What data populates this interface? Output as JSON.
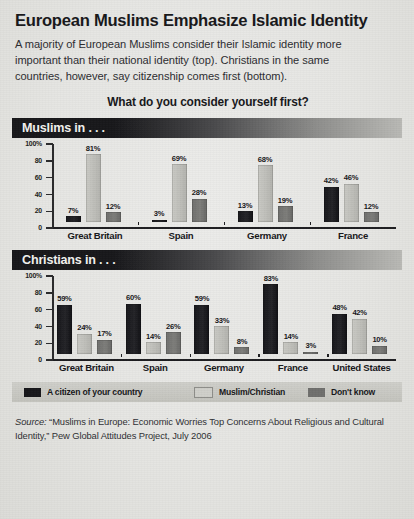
{
  "header": {
    "title": "European Muslims Emphasize Islamic Identity",
    "subtitle": "A majority of European Muslims consider their Islamic identity more important than their national identity (top). Christians in the same countries, however, say citizenship comes first (bottom).",
    "question": "What do you consider yourself first?"
  },
  "legend": {
    "items": [
      {
        "label": "A citizen of your country",
        "color": "#16161a",
        "swatch": "swatch-black"
      },
      {
        "label": "Muslim/Christian",
        "color": "#cfcfca",
        "swatch": "swatch-light-gray"
      },
      {
        "label": "Don't know",
        "color": "#6f6f6d",
        "swatch": "swatch-dark-gray"
      }
    ]
  },
  "source": {
    "prefix": "Source:",
    "text": " “Muslims in Europe: Economic Worries Top Concerns About Religious and Cultural Identity,” Pew Global Attitudes Project, July 2006"
  },
  "chart_data": [
    {
      "type": "bar",
      "title": "Muslims in . . .",
      "xlabel": "",
      "ylabel": "",
      "ylim": [
        0,
        100
      ],
      "yticks": [
        0,
        20,
        40,
        60,
        80,
        100
      ],
      "ytick_labels": [
        "0",
        "20",
        "40",
        "60",
        "80",
        "100%"
      ],
      "grid": false,
      "legend_position": "bottom",
      "categories": [
        "Great Britain",
        "Spain",
        "Germany",
        "France"
      ],
      "series": [
        {
          "name": "A citizen of your country",
          "color": "#16161a",
          "values": [
            7,
            3,
            13,
            42
          ],
          "labels": [
            "7%",
            "3%",
            "13%",
            "42%"
          ]
        },
        {
          "name": "Muslim/Christian",
          "color": "#cfcfca",
          "values": [
            81,
            69,
            68,
            46
          ],
          "labels": [
            "81%",
            "69%",
            "68%",
            "46%"
          ]
        },
        {
          "name": "Don't know",
          "color": "#6f6f6d",
          "values": [
            12,
            28,
            19,
            12
          ],
          "labels": [
            "12%",
            "28%",
            "19%",
            "12%"
          ]
        }
      ]
    },
    {
      "type": "bar",
      "title": "Christians in . . .",
      "xlabel": "",
      "ylabel": "",
      "ylim": [
        0,
        100
      ],
      "yticks": [
        0,
        20,
        40,
        60,
        80,
        100
      ],
      "ytick_labels": [
        "0",
        "20",
        "40",
        "60",
        "80",
        "100%"
      ],
      "grid": false,
      "legend_position": "bottom",
      "categories": [
        "Great Britain",
        "Spain",
        "Germany",
        "France",
        "United States"
      ],
      "series": [
        {
          "name": "A citizen of your country",
          "color": "#16161a",
          "values": [
            59,
            60,
            59,
            83,
            48
          ],
          "labels": [
            "59%",
            "60%",
            "59%",
            "83%",
            "48%"
          ]
        },
        {
          "name": "Muslim/Christian",
          "color": "#cfcfca",
          "values": [
            24,
            14,
            33,
            14,
            42
          ],
          "labels": [
            "24%",
            "14%",
            "33%",
            "14%",
            "42%"
          ]
        },
        {
          "name": "Don't know",
          "color": "#6f6f6d",
          "values": [
            17,
            26,
            8,
            3,
            10
          ],
          "labels": [
            "17%",
            "26%",
            "8%",
            "3%",
            "10%"
          ]
        }
      ]
    }
  ]
}
